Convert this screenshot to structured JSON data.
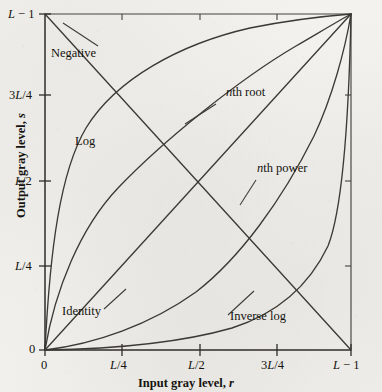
{
  "figure": {
    "type": "line-chart",
    "kind": "gray-level-transformation-functions",
    "ink_color": "#3a3834",
    "text_color": "#15130f",
    "background_color": "#f1f0ec"
  },
  "axes": {
    "x": {
      "title_plain": "Input gray level, ",
      "title_italic": "r",
      "ticks": [
        "0",
        "L/4",
        "L/2",
        "3L/4",
        "L − 1"
      ],
      "tick_parts": [
        {
          "pre": "0",
          "it": "",
          "post": ""
        },
        {
          "pre": "",
          "it": "L",
          "post": "/4"
        },
        {
          "pre": "",
          "it": "L",
          "post": "/2"
        },
        {
          "pre": "3",
          "it": "L",
          "post": "/4"
        },
        {
          "pre": "",
          "it": "L",
          "post": " − 1"
        }
      ],
      "range": [
        0,
        1
      ]
    },
    "y": {
      "title_plain": "Output gray level, ",
      "title_italic": "s",
      "ticks": [
        "0",
        "L/4",
        "L/2",
        "3L/4",
        "L − 1"
      ],
      "tick_parts": [
        {
          "pre": "0",
          "it": "",
          "post": ""
        },
        {
          "pre": "",
          "it": "L",
          "post": "/4"
        },
        {
          "pre": "",
          "it": "L",
          "post": "/2"
        },
        {
          "pre": "3",
          "it": "L",
          "post": "/4"
        },
        {
          "pre": "",
          "it": "L",
          "post": " − 1"
        }
      ],
      "range": [
        0,
        1
      ]
    },
    "frame": "left-and-bottom-spines-plus-top-and-right-border",
    "grid": false,
    "legend": "inline-curve-labels-with-leader-lines"
  },
  "curves": [
    {
      "name": "Negative",
      "label": "Negative",
      "label_parts": {
        "pre": "Negative",
        "it": "",
        "post": ""
      },
      "formula": "s = (L-1) - r",
      "endpoints": [
        [
          0,
          1
        ],
        [
          1,
          0
        ]
      ],
      "label_pos": {
        "x": 51,
        "y": 53
      },
      "leader": [
        [
          98,
          48
        ],
        [
          62,
          24
        ]
      ]
    },
    {
      "name": "Log",
      "label": "Log",
      "label_parts": {
        "pre": "Log",
        "it": "",
        "post": ""
      },
      "formula": "s = c log(1 + r)",
      "exponent": 0.22,
      "endpoints": [
        [
          0,
          0
        ],
        [
          1,
          1
        ]
      ],
      "label_pos": {
        "x": 75,
        "y": 141
      },
      "leader": null
    },
    {
      "name": "nth root",
      "label": "nth root",
      "label_parts": {
        "pre": "",
        "it": "n",
        "post": "th root"
      },
      "formula": "s = c r^(1/n)",
      "exponent": 0.45,
      "endpoints": [
        [
          0,
          0
        ],
        [
          1,
          1
        ]
      ],
      "label_pos": {
        "x": 228,
        "y": 92
      },
      "leader": [
        [
          215,
          103
        ],
        [
          186,
          122
        ]
      ]
    },
    {
      "name": "Identity",
      "label": "Identity",
      "label_parts": {
        "pre": "Identity",
        "it": "",
        "post": ""
      },
      "formula": "s = r",
      "exponent": 1.0,
      "endpoints": [
        [
          0,
          0
        ],
        [
          1,
          1
        ]
      ],
      "label_pos": {
        "x": 65,
        "y": 315
      },
      "leader": [
        [
          103,
          310
        ],
        [
          124,
          291
        ]
      ]
    },
    {
      "name": "nth power",
      "label": "nth power",
      "label_parts": {
        "pre": "",
        "it": "n",
        "post": "th power"
      },
      "formula": "s = c r^n",
      "exponent": 2.2,
      "endpoints": [
        [
          0,
          0
        ],
        [
          1,
          1
        ]
      ],
      "label_pos": {
        "x": 259,
        "y": 168
      },
      "leader": [
        [
          257,
          180
        ],
        [
          241,
          203
        ]
      ]
    },
    {
      "name": "Inverse log",
      "label": "Inverse log",
      "label_parts": {
        "pre": "Inverse log",
        "it": "",
        "post": ""
      },
      "formula": "s = c (exp(r) - 1)",
      "exponent": 4.6,
      "endpoints": [
        [
          0,
          0
        ],
        [
          1,
          1
        ]
      ],
      "label_pos": {
        "x": 232,
        "y": 318
      },
      "leader": [
        [
          229,
          314
        ],
        [
          253,
          292
        ]
      ]
    }
  ],
  "chart_data": {
    "type": "line",
    "title": "",
    "xlabel": "Input gray level, r",
    "ylabel": "Output gray level, s",
    "xlim": [
      0,
      1
    ],
    "ylim": [
      0,
      1
    ],
    "xtick_labels": [
      "0",
      "L/4",
      "L/2",
      "3L/4",
      "L − 1"
    ],
    "ytick_labels": [
      "0",
      "L/4",
      "L/2",
      "3L/4",
      "L − 1"
    ],
    "xtick_values": [
      0,
      0.25,
      0.5,
      0.75,
      1
    ],
    "ytick_values": [
      0,
      0.25,
      0.5,
      0.75,
      1
    ],
    "grid": false,
    "legend": "inline labels",
    "x": [
      0,
      0.125,
      0.25,
      0.375,
      0.5,
      0.625,
      0.75,
      0.875,
      1
    ],
    "series": [
      {
        "name": "Negative",
        "values": [
          1,
          0.875,
          0.75,
          0.625,
          0.5,
          0.375,
          0.25,
          0.125,
          0
        ]
      },
      {
        "name": "Log",
        "values": [
          0,
          0.63,
          0.74,
          0.81,
          0.86,
          0.9,
          0.94,
          0.97,
          1
        ]
      },
      {
        "name": "nth root",
        "values": [
          0,
          0.39,
          0.53,
          0.64,
          0.73,
          0.81,
          0.88,
          0.94,
          1
        ]
      },
      {
        "name": "Identity",
        "values": [
          0,
          0.125,
          0.25,
          0.375,
          0.5,
          0.625,
          0.75,
          0.875,
          1
        ]
      },
      {
        "name": "nth power",
        "values": [
          0,
          0.01,
          0.05,
          0.11,
          0.22,
          0.36,
          0.54,
          0.75,
          1
        ]
      },
      {
        "name": "Inverse log",
        "values": [
          0,
          0.001,
          0.004,
          0.02,
          0.04,
          0.1,
          0.23,
          0.48,
          1
        ]
      }
    ]
  }
}
